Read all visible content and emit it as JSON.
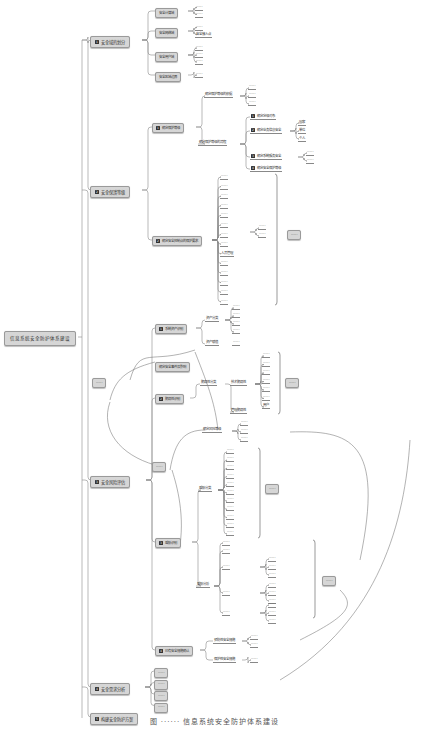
{
  "root": {
    "label": "信息系统安全防护体系建设"
  },
  "branches": [
    {
      "num": "1",
      "label": "安全域的划分"
    },
    {
      "num": "2",
      "label": "安全保護等级"
    },
    {
      "num": "3",
      "label": "安全风险评估"
    },
    {
      "num": "4",
      "label": "安全需求分析"
    },
    {
      "num": "5",
      "label": "构建安全防护方案"
    }
  ],
  "domain": {
    "children": [
      {
        "label": "安全计算域",
        "leaves": [
          "······",
          "······"
        ]
      },
      {
        "label": "安全网络域",
        "leaves": [
          "······",
          "安全接入点"
        ]
      },
      {
        "label": "安全用户域",
        "leaves": [
          "······",
          "······",
          "······"
        ]
      },
      {
        "label": "安全区域边界",
        "leaves": [
          "······"
        ]
      }
    ]
  },
  "grading": {
    "sub1": {
      "num": "1",
      "label": "确定保护等级"
    },
    "sub1_children": [
      {
        "label": "确定保护等级的依据",
        "leaves": [
          "······",
          "······",
          "······"
        ]
      },
      {
        "label": "确定保护等级的流程"
      }
    ],
    "flow_steps": [
      {
        "num": "1",
        "label": "确定定级对象"
      },
      {
        "num": "2",
        "label": "确定业务信息安全",
        "leaves": [
          "国家",
          "单位",
          "个人"
        ]
      },
      {
        "num": "3",
        "label": "确定系统服务安全",
        "leaves": [
          "······",
          "······"
        ]
      },
      {
        "num": "4",
        "label": "确定安全保护等级"
      }
    ],
    "sub2": {
      "num": "2",
      "label": "确定安全控制点的保护要求"
    },
    "controls": [
      "······",
      "······",
      "······",
      "······",
      "······",
      "······",
      "······",
      "······",
      "人员管理",
      "······",
      "······",
      "······",
      "······",
      "······"
    ],
    "control_extra": [
      "······",
      "······"
    ],
    "control_note": "······"
  },
  "risk": {
    "asset": {
      "num": "1",
      "label": "系统资产识别"
    },
    "asset_children": [
      {
        "label": "资产分类",
        "leaves": [
          "······",
          "······",
          "······",
          "······"
        ]
      },
      {
        "label": "资产赋值",
        "leaves": [
          "······"
        ]
      }
    ],
    "threat_event": {
      "label": "确定安全事件及影响"
    },
    "vuln": {
      "num": "2",
      "label": "脆弱性识别"
    },
    "vuln_children": [
      {
        "label": "脆弱性分类",
        "sub": "技术脆弱性",
        "leaves": [
          "······",
          "······",
          "······",
          "······",
          "······",
          "······",
          "用户"
        ]
      },
      {
        "label": "管理脆弱性"
      }
    ],
    "vuln_note": "······",
    "vuln_assess": {
      "label": "······",
      "leaves": [
        "······",
        "······",
        "······"
      ]
    },
    "risk_calc": {
      "label": "确定风险等级"
    },
    "threat": {
      "num": "3",
      "label": "威胁识别"
    },
    "threat_classes": {
      "label": "威胁分类",
      "leaves": [
        "······",
        "······",
        "······",
        "······",
        "······",
        "······",
        "······",
        "······",
        "······",
        "······",
        "······"
      ]
    },
    "threat_note": "······",
    "threat_analysis": {
      "label": "威胁分析",
      "groups": [
        {
          "label": "······",
          "leaves": []
        },
        {
          "label": "······",
          "leaves": []
        },
        {
          "label": "······",
          "leaves": [
            "······",
            "······",
            "······"
          ]
        },
        {
          "label": "······",
          "leaves": [
            "······",
            "······",
            "······"
          ]
        },
        {
          "label": "······",
          "leaves": [
            "······",
            "······",
            "······"
          ]
        }
      ]
    },
    "threat_note2": "······",
    "existing": {
      "num": "4",
      "label": "已有安全措施确认"
    },
    "existing_children": [
      {
        "label": "预防性安全措施",
        "leaves": [
          "······",
          "······"
        ]
      },
      {
        "label": "保护性安全措施",
        "leaves": [
          "······"
        ]
      }
    ]
  },
  "needs": {
    "items": [
      "······",
      "······",
      "······",
      "······"
    ]
  },
  "caption": "图 ······ 信息系统安全防护体系建设"
}
